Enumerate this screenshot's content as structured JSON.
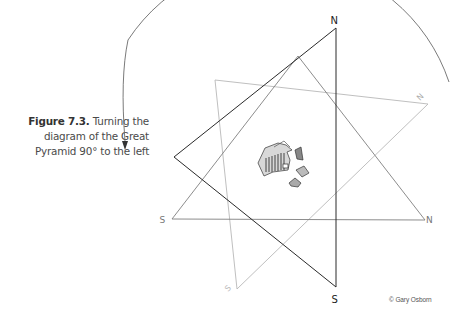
{
  "figure": {
    "number_label": "Figure 7.3.",
    "caption_line1_rest": "Turning the",
    "caption_line2": "diagram of the Great",
    "caption_line3": "Pyramid 90° to the left"
  },
  "diagram": {
    "black_triangle_labels": {
      "top": "N",
      "bottom": "S"
    },
    "horizontal_triangle_labels": {
      "left": "S",
      "right": "N"
    },
    "faint_triangle_labels": {
      "top_right": "N",
      "bottom_left": "S"
    },
    "rotation_arrow": "counter-clockwise arc with arrowhead",
    "center_image": "Great Pyramid plan schematic"
  },
  "credit": "© Gary Osborn",
  "colors": {
    "black_line": "#2a2a2a",
    "gray_line": "#8a8a8a",
    "faint_line": "#b8b8b8",
    "arc": "#6b6b6b"
  }
}
